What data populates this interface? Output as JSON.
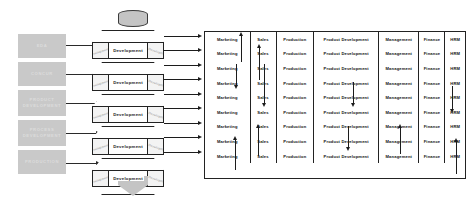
{
  "stages": [
    {
      "label": "EDA"
    },
    {
      "label": "CONCUR"
    },
    {
      "label": "PRODUCT DEVELOPMENT"
    },
    {
      "label": "PROCESS DEVELOPMENT"
    },
    {
      "label": "PRODUCTION"
    }
  ],
  "prism": {
    "unit_label": "Development",
    "side_label_left": "Development",
    "side_label_right": "Development",
    "count": 5,
    "cap_name": "input-cylinder",
    "funnel_name": "output-funnel"
  },
  "matrix": {
    "columns": [
      "Marketing",
      "Sales",
      "Production",
      "Product Development",
      "Management",
      "Finance",
      "HRM"
    ],
    "row_count": 9,
    "rows": [
      [
        "Marketing",
        "Sales",
        "Production",
        "Product Development",
        "Management",
        "Finance",
        "HRM"
      ],
      [
        "Marketing",
        "Sales",
        "Production",
        "Product Development",
        "Management",
        "Finance",
        "HRM"
      ],
      [
        "Marketing",
        "Sales",
        "Production",
        "Product Development",
        "Management",
        "Finance",
        "HRM"
      ],
      [
        "Marketing",
        "Sales",
        "Production",
        "Product Development",
        "Management",
        "Finance",
        "HRM"
      ],
      [
        "Marketing",
        "Sales",
        "Production",
        "Product Development",
        "Management",
        "Finance",
        "HRM"
      ],
      [
        "Marketing",
        "Sales",
        "Production",
        "Product Development",
        "Management",
        "Finance",
        "HRM"
      ],
      [
        "Marketing",
        "Sales",
        "Production",
        "Product Development",
        "Management",
        "Finance",
        "HRM"
      ],
      [
        "Marketing",
        "Sales",
        "Production",
        "Product Development",
        "Management",
        "Finance",
        "HRM"
      ],
      [
        "Marketing",
        "Sales",
        "Production",
        "Product Development",
        "Management",
        "Finance",
        "HRM"
      ]
    ]
  },
  "colors": {
    "stage_block": "#c9c9c9",
    "stage_text": "#dcdcdc",
    "line": "#1c1c1c",
    "prism_face": "#ffffff",
    "prism_side": "#f3f3f3",
    "cylinder": "#c4c4c4",
    "background": "#ffffff"
  }
}
